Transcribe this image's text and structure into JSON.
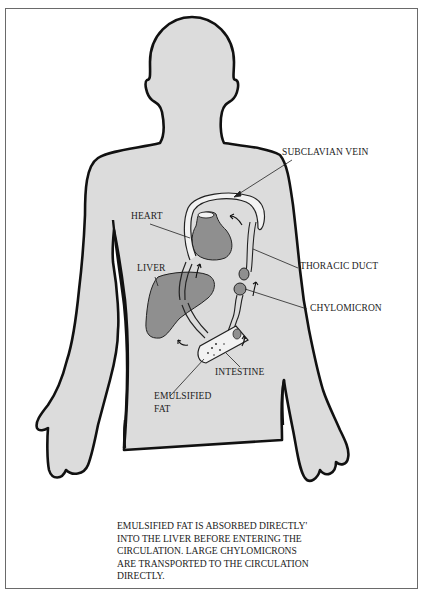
{
  "figure": {
    "type": "anatomical-diagram",
    "labels": {
      "subclavian_vein": "SUBCLAVIAN VEIN",
      "heart": "HEART",
      "thoracic_duct": "THORACIC DUCT",
      "liver": "LIVER",
      "chylomicron": "CHYLOMICRON",
      "intestine": "INTESTINE",
      "emulsified_fat_line1": "EMULSIFIED",
      "emulsified_fat_line2": "FAT"
    },
    "caption": {
      "lines": [
        "EMULSIFIED FAT IS ABSORBED DIRECTLY'",
        "INTO THE LIVER BEFORE ENTERING THE",
        "CIRCULATION. LARGE CHYLOMICRONS",
        "ARE TRANSPORTED TO THE CIRCULATION",
        "DIRECTLY."
      ]
    },
    "colors": {
      "body_fill": "#dcdcdc",
      "organ_fill": "#8f8f8f",
      "outline": "#111111",
      "vessel_fill": "#f2f2f2",
      "frame_border": "#6a6a6a"
    }
  }
}
